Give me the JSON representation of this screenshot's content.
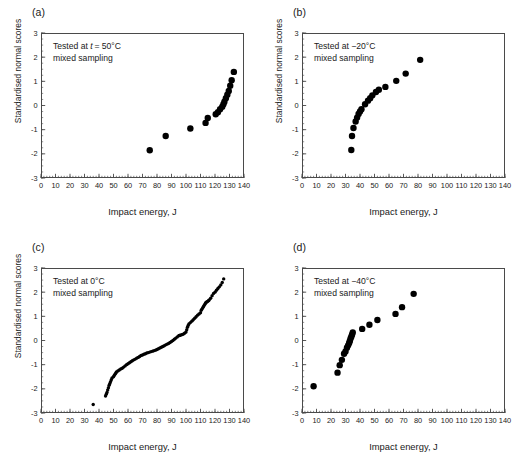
{
  "figure": {
    "layout": "2x2 grid of normal probability plots",
    "panel_labels": [
      "(a)",
      "(b)",
      "(c)",
      "(d)"
    ]
  },
  "axes": {
    "xlabel": "Impact energy, J",
    "ylabel": "Standardised normal scores",
    "xlim": [
      0,
      140
    ],
    "ylim": [
      -3,
      3
    ],
    "xticks": [
      0,
      10,
      20,
      30,
      40,
      50,
      60,
      70,
      80,
      90,
      100,
      110,
      120,
      130,
      140
    ],
    "xticklabels": [
      "0",
      "10",
      "20",
      "30",
      "40",
      "50",
      "60",
      "70",
      "80",
      "90",
      "100",
      "110",
      "120",
      "130",
      "140"
    ],
    "yticks": [
      -3,
      -2,
      -1,
      0,
      1,
      2,
      3
    ],
    "yticklabels": [
      "-3",
      "-2",
      "-1",
      "0",
      "1",
      "2",
      "3"
    ],
    "grid": false,
    "minor_ticks": true,
    "marker_color": "#000000",
    "frame_color": "#4a4a4a"
  },
  "chart_data": [
    {
      "type": "scatter",
      "panel": "(a)",
      "title": "",
      "annotation_line1": "Tested at t = 50°C",
      "annotation_line1_prefix": "Tested at ",
      "annotation_line1_italic": "t",
      "annotation_line1_suffix": " = 50°C",
      "annotation_line2": "mixed sampling",
      "xlabel": "Impact energy, J",
      "ylabel": "Standardised normal scores",
      "xlim": [
        0,
        140
      ],
      "ylim": [
        -3,
        3
      ],
      "marker_size": 3.2,
      "x": [
        75,
        86,
        103,
        113.5,
        115,
        120.5,
        122,
        123.5,
        125,
        125.8,
        126.5,
        127.5,
        128.5,
        129.5,
        130.5,
        131.5,
        133
      ],
      "y": [
        -1.85,
        -1.26,
        -0.95,
        -0.72,
        -0.52,
        -0.36,
        -0.28,
        -0.15,
        -0.05,
        0.05,
        0.16,
        0.3,
        0.45,
        0.6,
        0.82,
        1.05,
        1.39,
        1.95
      ]
    },
    {
      "type": "scatter",
      "panel": "(b)",
      "title": "",
      "annotation_line1": "Tested at −20°C",
      "annotation_line2": "mixed sampling",
      "xlabel": "Impact energy, J",
      "ylabel": "Standardised normal scores",
      "xlim": [
        0,
        140
      ],
      "ylim": [
        -3,
        3
      ],
      "marker_size": 3.2,
      "x": [
        34,
        34.5,
        35.5,
        37,
        38,
        39,
        40,
        41,
        43.5,
        45.5,
        47,
        48.5,
        51,
        53,
        57.5,
        65,
        71.5,
        81.5
      ],
      "y": [
        -1.84,
        -1.26,
        -0.93,
        -0.66,
        -0.5,
        -0.35,
        -0.25,
        -0.15,
        0.05,
        0.2,
        0.3,
        0.42,
        0.56,
        0.65,
        0.77,
        1.02,
        1.32,
        1.89
      ]
    },
    {
      "type": "scatter",
      "panel": "(c)",
      "title": "",
      "annotation_line1": "Tested at 0°C",
      "annotation_line2": "mixed sampling",
      "xlabel": "Impact energy, J",
      "ylabel": "Standardised normal scores",
      "xlim": [
        0,
        140
      ],
      "ylim": [
        -3,
        3
      ],
      "marker_size": 1.7,
      "x": [
        36,
        44.5,
        45,
        45.5,
        46,
        46.5,
        47,
        47.5,
        48,
        48.5,
        49,
        50,
        50.5,
        51,
        51.5,
        52,
        53,
        54,
        55,
        56,
        57,
        58,
        59,
        60,
        61,
        62,
        63,
        64,
        65,
        66,
        67,
        68,
        69,
        70,
        71,
        72,
        73,
        74,
        75,
        76,
        77,
        78,
        79,
        80,
        81,
        82,
        83,
        84,
        85,
        86,
        87,
        88,
        89,
        90,
        91,
        92,
        93,
        94,
        95,
        95.5,
        96,
        97,
        98,
        99,
        100,
        100.5,
        101,
        101.5,
        102,
        103,
        104,
        105,
        106,
        107,
        108,
        109,
        110,
        110.5,
        111,
        111.5,
        112,
        112.5,
        113,
        113.5,
        114,
        114.5,
        115,
        115.5,
        116,
        117,
        118,
        119,
        120,
        121,
        122,
        123,
        124,
        125,
        126
      ],
      "y": [
        -2.65,
        -2.3,
        -2.22,
        -2.15,
        -2.05,
        -1.95,
        -1.85,
        -1.78,
        -1.7,
        -1.62,
        -1.55,
        -1.5,
        -1.45,
        -1.4,
        -1.35,
        -1.3,
        -1.26,
        -1.22,
        -1.18,
        -1.15,
        -1.1,
        -1.05,
        -1.0,
        -0.96,
        -0.92,
        -0.88,
        -0.84,
        -0.8,
        -0.77,
        -0.73,
        -0.7,
        -0.66,
        -0.62,
        -0.6,
        -0.57,
        -0.55,
        -0.52,
        -0.5,
        -0.48,
        -0.46,
        -0.44,
        -0.42,
        -0.4,
        -0.37,
        -0.34,
        -0.31,
        -0.28,
        -0.25,
        -0.22,
        -0.18,
        -0.15,
        -0.12,
        -0.08,
        -0.04,
        0.0,
        0.05,
        0.1,
        0.15,
        0.2,
        0.21,
        0.22,
        0.24,
        0.26,
        0.3,
        0.35,
        0.45,
        0.55,
        0.62,
        0.68,
        0.74,
        0.8,
        0.86,
        0.92,
        0.98,
        1.05,
        1.1,
        1.15,
        1.25,
        1.3,
        1.35,
        1.4,
        1.45,
        1.5,
        1.55,
        1.58,
        1.6,
        1.62,
        1.65,
        1.68,
        1.75,
        1.85,
        1.95,
        2.0,
        2.08,
        2.15,
        2.22,
        2.3,
        2.4,
        2.55,
        2.75
      ]
    },
    {
      "type": "scatter",
      "panel": "(d)",
      "title": "",
      "annotation_line1": "Tested at −40°C",
      "annotation_line2": "mixed sampling",
      "xlabel": "Impact energy, J",
      "ylabel": "Standardised normal scores",
      "xlim": [
        0,
        140
      ],
      "ylim": [
        -3,
        3
      ],
      "marker_size": 3.2,
      "x": [
        8,
        24.5,
        26,
        27.5,
        29,
        30,
        31,
        31.8,
        32.5,
        33,
        33.5,
        34,
        34.5,
        35,
        41.5,
        46.5,
        52,
        64.5,
        69,
        77
      ],
      "y": [
        -1.89,
        -1.33,
        -1.02,
        -0.8,
        -0.55,
        -0.45,
        -0.3,
        -0.2,
        -0.1,
        -0.02,
        0.08,
        0.16,
        0.24,
        0.33,
        0.48,
        0.65,
        0.85,
        1.1,
        1.38,
        1.93
      ]
    }
  ]
}
